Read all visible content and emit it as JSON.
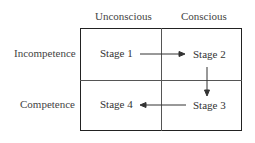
{
  "columns": [
    "Unconscious",
    "Conscious"
  ],
  "rows": [
    "Incompetence",
    "Competence"
  ],
  "stages": [
    {
      "label": "Stage 1",
      "row": 0,
      "col": 0
    },
    {
      "label": "Stage 2",
      "row": 0,
      "col": 1
    },
    {
      "label": "Stage 3",
      "row": 1,
      "col": 1
    },
    {
      "label": "Stage 4",
      "row": 1,
      "col": 0
    }
  ],
  "arrows": [
    {
      "from": "Stage 1",
      "to": "Stage 2"
    },
    {
      "from": "Stage 2",
      "to": "Stage 3"
    },
    {
      "from": "Stage 3",
      "to": "Stage 4"
    }
  ]
}
